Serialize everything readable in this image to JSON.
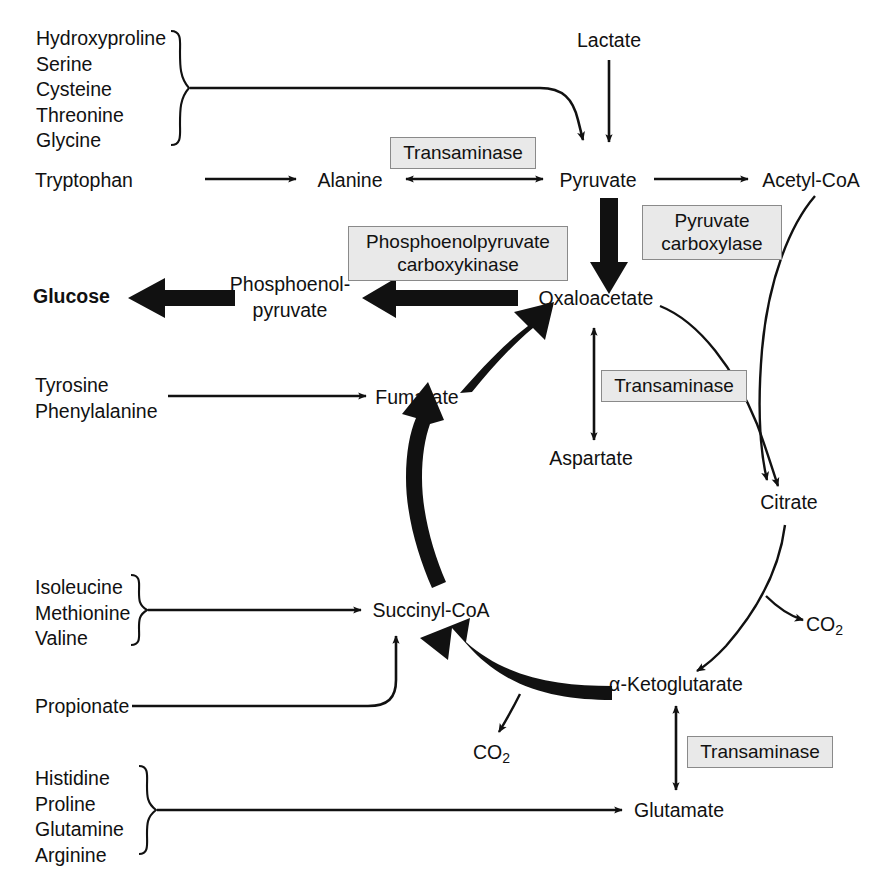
{
  "diagram": {
    "colors": {
      "ink": "#111111",
      "enzyme_fill": "#e9e9e9",
      "enzyme_border": "#8a8a8a",
      "background": "#ffffff"
    }
  },
  "metabolites": {
    "lactate": "Lactate",
    "tryptophan": "Tryptophan",
    "alanine": "Alanine",
    "pyruvate": "Pyruvate",
    "acetyl_coa": "Acetyl-CoA",
    "glucose": "Glucose",
    "pep_line1": "Phosphoenol-",
    "pep_line2": "pyruvate",
    "oxaloacetate": "Oxaloacetate",
    "aspartate": "Aspartate",
    "fumarate": "Fumarate",
    "citrate": "Citrate",
    "alpha_ketoglutarate": "α-Ketoglutarate",
    "succinyl_coa": "Succinyl-CoA",
    "propionate": "Propionate",
    "glutamate": "Glutamate",
    "co2_a": "CO",
    "co2_a_sub": "2",
    "co2_b": "CO",
    "co2_b_sub": "2"
  },
  "enzymes": {
    "transaminase_alanine": "Transaminase",
    "pyruvate_carboxylase_line1": "Pyruvate",
    "pyruvate_carboxylase_line2": "carboxylase",
    "pepck_line1": "Phosphoenolpyruvate",
    "pepck_line2": "carboxykinase",
    "transaminase_aspartate": "Transaminase",
    "transaminase_glutamate": "Transaminase"
  },
  "amino_acid_groups": [
    {
      "id": "to-pyruvate",
      "items": [
        "Hydroxyproline",
        "Serine",
        "Cysteine",
        "Threonine",
        "Glycine"
      ]
    },
    {
      "id": "to-fumarate",
      "items": [
        "Tyrosine",
        "Phenylalanine"
      ]
    },
    {
      "id": "to-succinyl-coa",
      "items": [
        "Isoleucine",
        "Methionine",
        "Valine"
      ]
    },
    {
      "id": "to-glutamate",
      "items": [
        "Histidine",
        "Proline",
        "Glutamine",
        "Arginine"
      ]
    }
  ]
}
